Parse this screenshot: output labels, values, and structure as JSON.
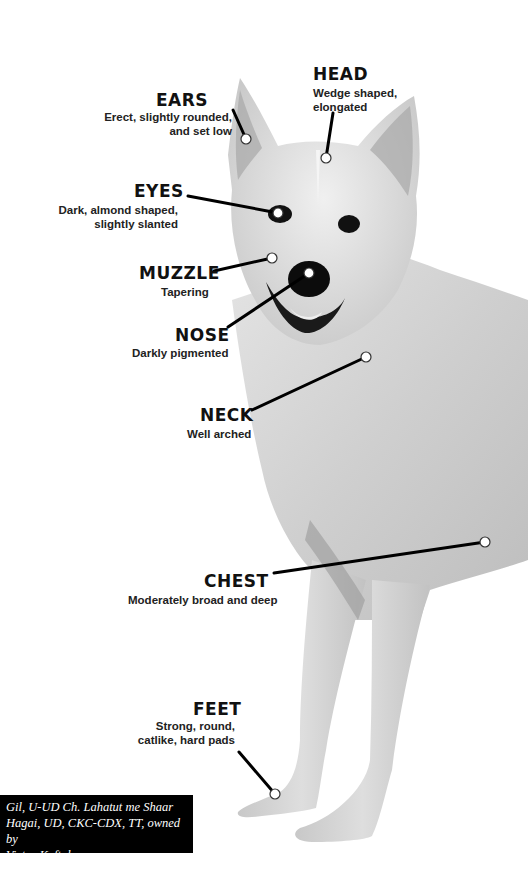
{
  "colors": {
    "background": "#ffffff",
    "leader_line": "#000000",
    "marker_fill": "#ffffff",
    "marker_stroke": "#333333",
    "caption_bg": "#000000",
    "caption_text": "#ffffff"
  },
  "labels": [
    {
      "id": "ears",
      "title": "EARS",
      "desc_lines": [
        "Erect, slightly rounded,",
        "and set low"
      ],
      "marker": [
        246,
        139
      ]
    },
    {
      "id": "head",
      "title": "HEAD",
      "desc_lines": [
        "Wedge shaped,",
        "elongated"
      ],
      "marker": [
        326,
        158
      ]
    },
    {
      "id": "eyes",
      "title": "EYES",
      "desc_lines": [
        "Dark, almond shaped,",
        "slightly slanted"
      ],
      "marker": [
        278,
        213
      ]
    },
    {
      "id": "muzzle",
      "title": "MUZZLE",
      "desc_lines": [
        "Tapering"
      ],
      "marker": [
        272,
        258
      ]
    },
    {
      "id": "nose",
      "title": "NOSE",
      "desc_lines": [
        "Darkly pigmented"
      ],
      "marker": [
        309,
        273
      ]
    },
    {
      "id": "neck",
      "title": "NECK",
      "desc_lines": [
        "Well arched"
      ],
      "marker": [
        366,
        357
      ]
    },
    {
      "id": "chest",
      "title": "CHEST",
      "desc_lines": [
        "Moderately broad and deep"
      ],
      "marker": [
        485,
        542
      ]
    },
    {
      "id": "feet",
      "title": "FEET",
      "desc_lines": [
        "Strong, round,",
        "catlike, hard pads"
      ],
      "marker": [
        275,
        794
      ]
    }
  ],
  "caption": {
    "lines": [
      "Gil, U-UD Ch. Lahatut me Shaar",
      "Hagai, UD, CKC-CDX, TT, owned by",
      "Victor Kaftal."
    ]
  }
}
